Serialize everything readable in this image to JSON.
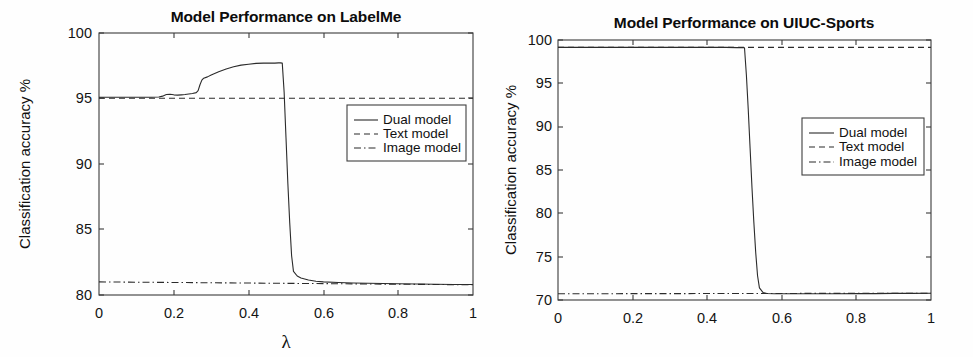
{
  "figure": {
    "background_color": "#ffffff",
    "panel_count": 2
  },
  "chart_data": [
    {
      "id": "labelme",
      "type": "line",
      "title": "Model Performance on LabelMe",
      "xlabel": "λ",
      "ylabel": "Classification accuracy %",
      "xlim": [
        0,
        1
      ],
      "ylim": [
        80,
        100
      ],
      "grid": false,
      "legend_position": "center-right",
      "xticks": [
        0,
        0.2,
        0.4,
        0.6,
        0.8,
        1
      ],
      "xticklabels": [
        "0",
        "0.2",
        "0.4",
        "0.6",
        "0.8",
        "1"
      ],
      "yticks": [
        80,
        85,
        90,
        95,
        100
      ],
      "yticklabels": [
        "80",
        "85",
        "90",
        "95",
        "100"
      ],
      "series": [
        {
          "name": "Dual model",
          "style": "solid",
          "color": "#2b2b2b",
          "x": [
            0.0,
            0.02,
            0.04,
            0.06,
            0.08,
            0.1,
            0.12,
            0.14,
            0.16,
            0.17,
            0.18,
            0.19,
            0.2,
            0.21,
            0.22,
            0.23,
            0.24,
            0.25,
            0.26,
            0.265,
            0.27,
            0.275,
            0.28,
            0.29,
            0.3,
            0.32,
            0.34,
            0.36,
            0.38,
            0.4,
            0.42,
            0.44,
            0.46,
            0.47,
            0.48,
            0.485,
            0.49,
            0.495,
            0.5,
            0.505,
            0.51,
            0.515,
            0.52,
            0.53,
            0.54,
            0.56,
            0.58,
            0.6,
            0.64,
            0.68,
            0.72,
            0.76,
            0.8,
            0.85,
            0.9,
            0.95,
            1.0
          ],
          "y": [
            95.1,
            95.1,
            95.1,
            95.1,
            95.1,
            95.1,
            95.1,
            95.1,
            95.12,
            95.18,
            95.3,
            95.32,
            95.28,
            95.26,
            95.28,
            95.3,
            95.34,
            95.38,
            95.45,
            95.6,
            96.05,
            96.4,
            96.55,
            96.65,
            96.8,
            97.05,
            97.25,
            97.42,
            97.55,
            97.62,
            97.68,
            97.7,
            97.7,
            97.7,
            97.72,
            97.72,
            97.7,
            95.5,
            92.0,
            88.5,
            85.5,
            83.0,
            81.8,
            81.45,
            81.3,
            81.15,
            81.05,
            81.0,
            80.95,
            80.92,
            80.9,
            80.88,
            80.86,
            80.84,
            80.82,
            80.8,
            80.8
          ]
        },
        {
          "name": "Text model",
          "style": "dashed",
          "color": "#2b2b2b",
          "x": [
            0,
            1
          ],
          "y": [
            95.02,
            95.02
          ]
        },
        {
          "name": "Image model",
          "style": "dashdot",
          "color": "#2b2b2b",
          "x": [
            0,
            1
          ],
          "y": [
            81.0,
            80.78
          ]
        }
      ]
    },
    {
      "id": "uiuc-sports",
      "type": "line",
      "title": "Model Performance on UIUC-Sports",
      "xlabel": "",
      "ylabel": "Classification accuracy %",
      "xlim": [
        0,
        1
      ],
      "ylim": [
        70,
        100
      ],
      "grid": false,
      "legend_position": "center-right",
      "xticks": [
        0,
        0.2,
        0.4,
        0.6,
        0.8,
        1
      ],
      "xticklabels": [
        "0",
        "0.2",
        "0.4",
        "0.6",
        "0.8",
        "1"
      ],
      "yticks": [
        70,
        75,
        80,
        85,
        90,
        95,
        100
      ],
      "yticklabels": [
        "70",
        "75",
        "80",
        "85",
        "90",
        "95",
        "100"
      ],
      "series": [
        {
          "name": "Dual model",
          "style": "solid",
          "color": "#2b2b2b",
          "x": [
            0.0,
            0.05,
            0.1,
            0.15,
            0.2,
            0.25,
            0.3,
            0.35,
            0.4,
            0.45,
            0.48,
            0.5,
            0.505,
            0.51,
            0.515,
            0.52,
            0.525,
            0.53,
            0.535,
            0.54,
            0.55,
            0.56,
            0.58,
            0.6,
            0.65,
            0.7,
            0.75,
            0.8,
            0.85,
            0.9,
            0.95,
            1.0
          ],
          "y": [
            99.15,
            99.15,
            99.15,
            99.15,
            99.15,
            99.15,
            99.15,
            99.15,
            99.15,
            99.15,
            99.12,
            99.1,
            96.0,
            92.0,
            87.5,
            83.0,
            79.0,
            75.5,
            72.8,
            71.4,
            70.85,
            70.75,
            70.72,
            70.72,
            70.72,
            70.72,
            70.72,
            70.74,
            70.74,
            70.76,
            70.76,
            70.78
          ]
        },
        {
          "name": "Text model",
          "style": "dashed",
          "color": "#2b2b2b",
          "x": [
            0,
            1
          ],
          "y": [
            99.15,
            99.15
          ]
        },
        {
          "name": "Image model",
          "style": "dashdot",
          "color": "#2b2b2b",
          "x": [
            0,
            1
          ],
          "y": [
            70.72,
            70.78
          ]
        }
      ]
    }
  ]
}
